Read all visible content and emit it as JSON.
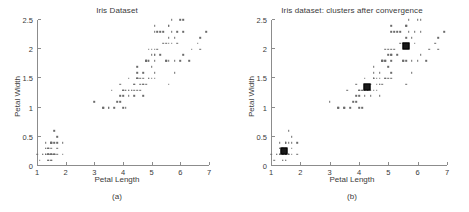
{
  "figure": {
    "panels": [
      {
        "id": "a",
        "title": "Iris Dataset",
        "caption": "(a)",
        "show_centroids": false
      },
      {
        "id": "b",
        "title": "Iris dataset: clusters after convergence",
        "caption": "(b)",
        "show_centroids": true
      }
    ]
  },
  "chart_data": {
    "type": "scatter",
    "title": "Iris Dataset",
    "title_b": "Iris dataset: clusters after convergence",
    "xlabel": "Petal Length",
    "ylabel": "Petal Width",
    "xlim": [
      1,
      7
    ],
    "ylim": [
      0,
      2.5
    ],
    "xticks": [
      1,
      2,
      3,
      4,
      5,
      6,
      7
    ],
    "xticklabels": [
      "1",
      "2",
      "3",
      "4",
      "5",
      "6",
      "7"
    ],
    "yticks": [
      0,
      0.5,
      1,
      1.5,
      2,
      2.5
    ],
    "yticklabels": [
      "0",
      "0.5",
      "1",
      "1.5",
      "2",
      "2.5"
    ],
    "grid": false,
    "legend": null,
    "marker": "dot",
    "marker_color": "#6b6b6b",
    "centroid_color": "#1a1a1a",
    "points": [
      [
        1.4,
        0.2
      ],
      [
        1.4,
        0.2
      ],
      [
        1.3,
        0.2
      ],
      [
        1.5,
        0.2
      ],
      [
        1.4,
        0.2
      ],
      [
        1.7,
        0.4
      ],
      [
        1.4,
        0.3
      ],
      [
        1.5,
        0.2
      ],
      [
        1.4,
        0.2
      ],
      [
        1.5,
        0.1
      ],
      [
        1.5,
        0.2
      ],
      [
        1.6,
        0.2
      ],
      [
        1.4,
        0.1
      ],
      [
        1.1,
        0.1
      ],
      [
        1.2,
        0.2
      ],
      [
        1.5,
        0.4
      ],
      [
        1.3,
        0.4
      ],
      [
        1.4,
        0.3
      ],
      [
        1.7,
        0.3
      ],
      [
        1.5,
        0.3
      ],
      [
        1.7,
        0.2
      ],
      [
        1.5,
        0.4
      ],
      [
        1.0,
        0.2
      ],
      [
        1.7,
        0.5
      ],
      [
        1.9,
        0.2
      ],
      [
        1.6,
        0.2
      ],
      [
        1.6,
        0.4
      ],
      [
        1.5,
        0.2
      ],
      [
        1.4,
        0.2
      ],
      [
        1.6,
        0.2
      ],
      [
        1.6,
        0.2
      ],
      [
        1.5,
        0.4
      ],
      [
        1.5,
        0.1
      ],
      [
        1.4,
        0.2
      ],
      [
        1.5,
        0.2
      ],
      [
        1.2,
        0.2
      ],
      [
        1.3,
        0.2
      ],
      [
        1.4,
        0.1
      ],
      [
        1.3,
        0.2
      ],
      [
        1.5,
        0.2
      ],
      [
        1.3,
        0.3
      ],
      [
        1.3,
        0.3
      ],
      [
        1.3,
        0.2
      ],
      [
        1.6,
        0.6
      ],
      [
        1.9,
        0.4
      ],
      [
        1.4,
        0.3
      ],
      [
        1.6,
        0.2
      ],
      [
        1.4,
        0.2
      ],
      [
        1.5,
        0.2
      ],
      [
        1.4,
        0.2
      ],
      [
        4.7,
        1.4
      ],
      [
        4.5,
        1.5
      ],
      [
        4.9,
        1.5
      ],
      [
        4.0,
        1.3
      ],
      [
        4.6,
        1.5
      ],
      [
        4.5,
        1.3
      ],
      [
        4.7,
        1.6
      ],
      [
        3.3,
        1.0
      ],
      [
        4.6,
        1.3
      ],
      [
        3.9,
        1.4
      ],
      [
        3.5,
        1.0
      ],
      [
        4.2,
        1.5
      ],
      [
        4.0,
        1.0
      ],
      [
        4.7,
        1.4
      ],
      [
        3.6,
        1.3
      ],
      [
        4.4,
        1.4
      ],
      [
        4.5,
        1.5
      ],
      [
        4.1,
        1.0
      ],
      [
        4.5,
        1.5
      ],
      [
        3.9,
        1.1
      ],
      [
        4.8,
        1.8
      ],
      [
        4.0,
        1.3
      ],
      [
        4.9,
        1.5
      ],
      [
        4.7,
        1.2
      ],
      [
        4.3,
        1.3
      ],
      [
        4.4,
        1.4
      ],
      [
        4.8,
        1.4
      ],
      [
        5.0,
        1.7
      ],
      [
        4.5,
        1.5
      ],
      [
        3.5,
        1.0
      ],
      [
        3.8,
        1.1
      ],
      [
        3.7,
        1.0
      ],
      [
        3.9,
        1.2
      ],
      [
        5.1,
        1.6
      ],
      [
        4.5,
        1.5
      ],
      [
        4.5,
        1.6
      ],
      [
        4.7,
        1.5
      ],
      [
        4.4,
        1.3
      ],
      [
        4.1,
        1.3
      ],
      [
        4.0,
        1.3
      ],
      [
        4.4,
        1.2
      ],
      [
        4.6,
        1.4
      ],
      [
        4.0,
        1.2
      ],
      [
        3.3,
        1.0
      ],
      [
        4.2,
        1.3
      ],
      [
        4.2,
        1.2
      ],
      [
        4.2,
        1.3
      ],
      [
        4.3,
        1.3
      ],
      [
        3.0,
        1.1
      ],
      [
        4.1,
        1.3
      ],
      [
        6.0,
        2.5
      ],
      [
        5.1,
        1.9
      ],
      [
        5.9,
        2.1
      ],
      [
        5.6,
        1.8
      ],
      [
        5.8,
        2.2
      ],
      [
        6.6,
        2.1
      ],
      [
        4.5,
        1.7
      ],
      [
        6.3,
        1.8
      ],
      [
        5.8,
        1.8
      ],
      [
        6.1,
        2.5
      ],
      [
        5.1,
        2.0
      ],
      [
        5.3,
        1.9
      ],
      [
        5.5,
        2.1
      ],
      [
        5.0,
        2.0
      ],
      [
        5.1,
        2.4
      ],
      [
        5.3,
        2.3
      ],
      [
        5.5,
        1.8
      ],
      [
        6.7,
        2.2
      ],
      [
        6.9,
        2.3
      ],
      [
        5.0,
        1.5
      ],
      [
        5.7,
        2.3
      ],
      [
        4.9,
        2.0
      ],
      [
        6.7,
        2.0
      ],
      [
        4.9,
        1.8
      ],
      [
        5.7,
        2.1
      ],
      [
        6.0,
        1.8
      ],
      [
        4.8,
        1.8
      ],
      [
        4.9,
        1.8
      ],
      [
        5.6,
        2.1
      ],
      [
        5.8,
        1.6
      ],
      [
        6.1,
        1.9
      ],
      [
        6.4,
        2.0
      ],
      [
        5.6,
        2.2
      ],
      [
        5.1,
        1.5
      ],
      [
        5.6,
        1.4
      ],
      [
        6.1,
        2.3
      ],
      [
        5.6,
        2.4
      ],
      [
        5.5,
        1.8
      ],
      [
        4.8,
        1.8
      ],
      [
        5.4,
        2.1
      ],
      [
        5.6,
        2.4
      ],
      [
        5.1,
        2.3
      ],
      [
        5.1,
        1.9
      ],
      [
        5.9,
        2.3
      ],
      [
        5.7,
        2.5
      ],
      [
        5.2,
        2.3
      ],
      [
        5.0,
        1.9
      ],
      [
        5.2,
        2.0
      ],
      [
        5.4,
        2.3
      ],
      [
        5.1,
        1.8
      ]
    ],
    "centroids": [
      [
        1.46,
        0.25
      ],
      [
        4.27,
        1.35
      ],
      [
        5.6,
        2.05
      ]
    ]
  }
}
